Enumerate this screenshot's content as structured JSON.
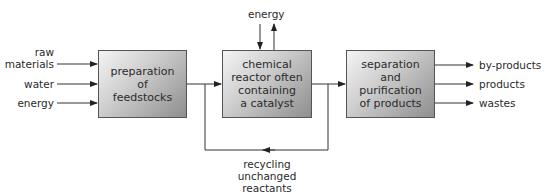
{
  "diagram": {
    "type": "process-flow",
    "boxes": [
      {
        "id": "prep",
        "label": "preparation\nof\nfeedstocks"
      },
      {
        "id": "reactor",
        "label": "chemical\nreactor often\ncontaining\na catalyst"
      },
      {
        "id": "separation",
        "label": "separation\nand\npurification\nof products"
      }
    ],
    "inputs": {
      "raw_materials": "raw\nmaterials",
      "water": "water",
      "energy": "energy"
    },
    "reactor_energy": "energy",
    "outputs": {
      "by_products": "by-products",
      "products": "products",
      "wastes": "wastes"
    },
    "recycle_label": "recycling unchanged\nreactants"
  }
}
